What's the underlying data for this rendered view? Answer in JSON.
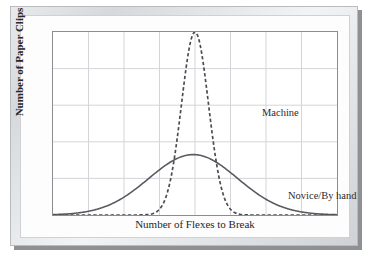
{
  "figure": {
    "kind": "printed-figure-scan",
    "background_color": "#fdfdfd",
    "frame_color": "#8b8d91",
    "grid_color": "#d3d5d8"
  },
  "chart_data": {
    "type": "line",
    "title": "",
    "subtitle": "",
    "xlabel": "Number of Flexes to Break",
    "ylabel": "Number of Paper Clips",
    "grid": true,
    "x_tick_labels": [],
    "y_tick_labels": [],
    "x_gridlines": 8,
    "y_gridlines": 5,
    "xlim": [
      0,
      8
    ],
    "ylim": [
      0,
      5
    ],
    "legend_position": "inline-annotation",
    "annotations": [
      {
        "text": "Machine",
        "x": 4.4,
        "y": 3.85
      },
      {
        "text": "Novice/By hand",
        "x": 5.1,
        "y": 1.6
      }
    ],
    "series": [
      {
        "name": "Machine",
        "style": "dashed",
        "color": "#4b4c50",
        "mean": 4.0,
        "sigma": 0.38,
        "peak": 5.0,
        "x": [
          2.6,
          2.9,
          3.1,
          3.3,
          3.5,
          3.65,
          3.8,
          3.9,
          4.0,
          4.1,
          4.2,
          4.35,
          4.5,
          4.7,
          4.9,
          5.1,
          5.4
        ],
        "values": [
          0.02,
          0.06,
          0.14,
          0.33,
          0.85,
          1.75,
          3.2,
          4.4,
          5.0,
          4.4,
          3.2,
          1.75,
          0.85,
          0.33,
          0.14,
          0.06,
          0.02
        ]
      },
      {
        "name": "Novice/By hand",
        "style": "solid",
        "color": "#5a5b60",
        "mean": 3.95,
        "sigma": 1.25,
        "peak": 1.65,
        "x": [
          1.0,
          1.4,
          1.8,
          2.2,
          2.6,
          3.0,
          3.4,
          3.7,
          3.95,
          4.2,
          4.5,
          4.9,
          5.3,
          5.7,
          6.1,
          6.5,
          6.9
        ],
        "values": [
          0.03,
          0.09,
          0.21,
          0.43,
          0.75,
          1.12,
          1.45,
          1.6,
          1.65,
          1.6,
          1.45,
          1.12,
          0.75,
          0.43,
          0.21,
          0.09,
          0.03
        ]
      }
    ]
  },
  "labels": {
    "y_axis": "Number of Paper Clips",
    "x_axis": "Number of Flexes to Break",
    "machine": "Machine",
    "novice": "Novice/By hand"
  }
}
